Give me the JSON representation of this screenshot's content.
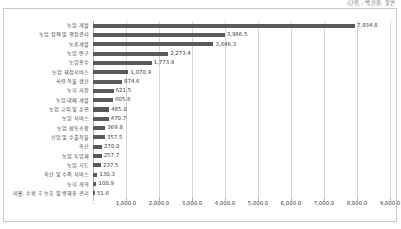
{
  "header": {
    "note": "(단위 : 백만원, 불변"
  },
  "chart_data": {
    "type": "bar",
    "orientation": "horizontal",
    "title": "",
    "xlabel": "",
    "ylabel": "",
    "xlim": [
      0,
      9000
    ],
    "grid": true,
    "legend": false,
    "bar_color": "#595959",
    "categories": [
      "농업 개발",
      "농업 정책 및 행정관리",
      "농촌개발",
      "농업 연구",
      "농업용수",
      "농업 재정서비스",
      "식량 작물 생산",
      "농지 자원",
      "농업 대체 개발",
      "농업 교육 및 훈련",
      "농업 서비스",
      "농업 협동조합",
      "산업 및 수출작물",
      "축산",
      "농업 투입재",
      "농업 지도",
      "축산 및 수의 서비스",
      "농지 개혁",
      "미활, 수확 후 보호 및 병해충 관리"
    ],
    "values": [
      7934.8,
      3986.5,
      3646.3,
      2273.4,
      1773.9,
      1070.9,
      874.6,
      621.5,
      605.6,
      485.0,
      470.7,
      369.8,
      357.5,
      270.0,
      257.7,
      237.5,
      130.3,
      100.9,
      51.6
    ],
    "value_labels": [
      "7,934.8",
      "3,986.5",
      "3,646.3",
      "2,273.4",
      "1,773.9",
      "1,070.9",
      "874.6",
      "621.5",
      "605.6",
      "485.0",
      "470.7",
      "369.8",
      "357.5",
      "270.0",
      "257.7",
      "237.5",
      "130.3",
      "100.9",
      "51.6"
    ],
    "xticks": [
      0,
      1000,
      2000,
      3000,
      4000,
      5000,
      6000,
      7000,
      8000,
      9000
    ],
    "xtick_labels": [
      "-",
      "1,000.0",
      "2,000.0",
      "3,000.0",
      "4,000.0",
      "5,000.0",
      "6,000.0",
      "7,000.0",
      "8,000.0",
      "9,000.0"
    ]
  }
}
